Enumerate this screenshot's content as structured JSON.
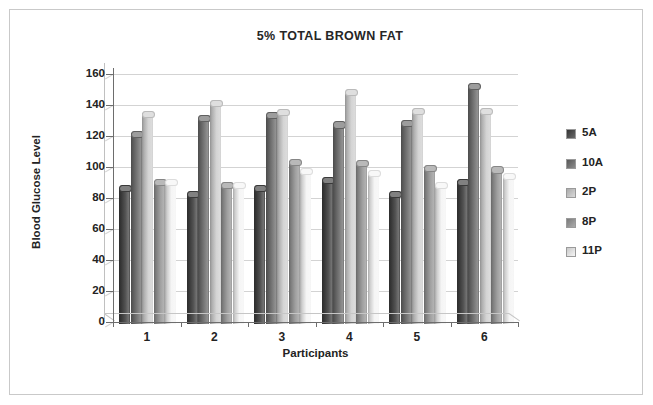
{
  "chart_data": {
    "type": "bar",
    "title": "5% TOTAL BROWN FAT",
    "xlabel": "Participants",
    "ylabel": "Blood Glucose Level",
    "categories": [
      "1",
      "2",
      "3",
      "4",
      "5",
      "6"
    ],
    "ylim": [
      0,
      160
    ],
    "ytick_step": 20,
    "yticks": [
      "0",
      "20",
      "40",
      "60",
      "80",
      "100",
      "120",
      "140",
      "160"
    ],
    "grid": true,
    "legend_position": "right",
    "style": "3d-cylinder-bars",
    "series": [
      {
        "name": "5A",
        "color": "#404040",
        "values": [
          88,
          84,
          88,
          93,
          84,
          92
        ]
      },
      {
        "name": "10A",
        "color": "#6b6b6b",
        "values": [
          123,
          133,
          135,
          129,
          130,
          154
        ]
      },
      {
        "name": "2P",
        "color": "#cfcfcf",
        "values": [
          136,
          143,
          137,
          150,
          138,
          138
        ]
      },
      {
        "name": "8P",
        "color": "#959595",
        "values": [
          92,
          90,
          105,
          104,
          101,
          100
        ]
      },
      {
        "name": "11P",
        "color": "#f4f4f4",
        "values": [
          92,
          90,
          99,
          98,
          90,
          96
        ]
      }
    ]
  },
  "legend": {
    "items": [
      {
        "label": "5A"
      },
      {
        "label": "10A"
      },
      {
        "label": "2P"
      },
      {
        "label": "8P"
      },
      {
        "label": "11P"
      }
    ]
  }
}
